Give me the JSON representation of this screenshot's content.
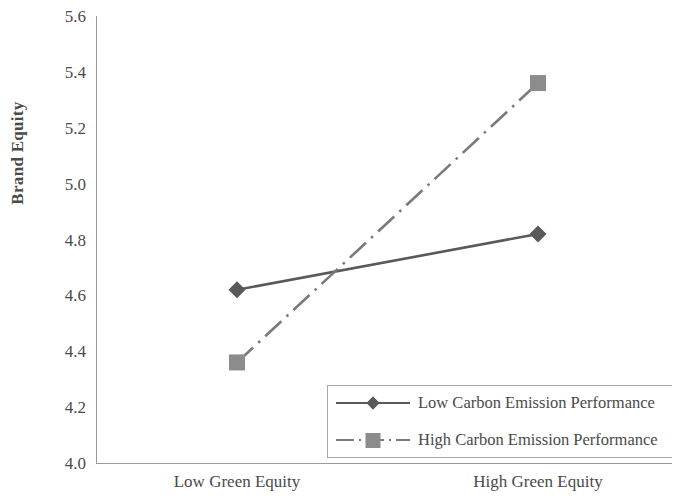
{
  "chart_data": {
    "type": "line",
    "title": "",
    "subtitle": "",
    "xlabel": "",
    "ylabel": "Brand Equity",
    "categories": [
      "Low Green Equity",
      "High Green Equity"
    ],
    "series": [
      {
        "name": "Low Carbon Emission Performance",
        "values": [
          4.62,
          4.82
        ],
        "line_style": "solid",
        "marker": "diamond",
        "color": "#595959"
      },
      {
        "name": "High Carbon Emission Performance",
        "values": [
          4.36,
          5.36
        ],
        "line_style": "dash-dot",
        "marker": "square",
        "color": "#7a7a7a"
      }
    ],
    "ylim": [
      4.0,
      5.6
    ],
    "ytick_step": 0.2,
    "ytick_labels": [
      "5.6",
      "5.4",
      "5.2",
      "5.0",
      "4.8",
      "4.6",
      "4.4",
      "4.2",
      "4.0"
    ],
    "ytick_values": [
      5.6,
      5.4,
      5.2,
      5.0,
      4.8,
      4.6,
      4.4,
      4.2,
      4.0
    ],
    "grid": false,
    "legend_position": "inside-bottom-right",
    "axis_color": "#9a9a9a",
    "text_color": "#4a4a4a"
  },
  "axes": {
    "y_title": "Brand Equity"
  },
  "legend": {
    "entries": [
      {
        "label": "Low Carbon Emission Performance"
      },
      {
        "label": "High Carbon Emission Performance"
      }
    ]
  }
}
